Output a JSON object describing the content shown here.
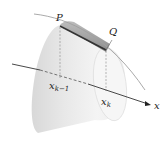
{
  "figure": {
    "labels": {
      "P": "P",
      "Q": "Q",
      "x_axis": "x",
      "x_left": "x",
      "x_left_sub": "k−1",
      "x_right": "x",
      "x_right_sub": "k"
    },
    "colors": {
      "surface_light": "#f2f2f2",
      "surface_mid": "#dcdcdc",
      "surface_dark": "#c4c4c4",
      "band_dark": "#8a8a8a",
      "segment": "#333333",
      "axis": "#333333",
      "curve": "#a0a0a0",
      "dashed": "#888888"
    }
  }
}
